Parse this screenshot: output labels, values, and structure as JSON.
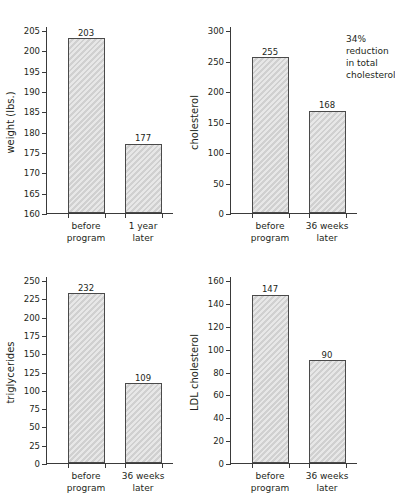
{
  "figure": {
    "panels": [
      {
        "name": "weight",
        "ylabel": "weight (lbs.)",
        "ticks": [
          "160",
          "165",
          "170",
          "175",
          "180",
          "185",
          "190",
          "195",
          "200",
          "205"
        ],
        "bars": [
          {
            "category": "before\nprogram",
            "value": "203"
          },
          {
            "category": "1 year\nlater",
            "value": "177"
          }
        ],
        "annotation": ""
      },
      {
        "name": "cholesterol",
        "ylabel": "cholesterol",
        "ticks": [
          "0",
          "50",
          "100",
          "150",
          "200",
          "250",
          "300"
        ],
        "bars": [
          {
            "category": "before\nprogram",
            "value": "255"
          },
          {
            "category": "36 weeks\nlater",
            "value": "168"
          }
        ],
        "annotation": "34%\nreduction\nin total\ncholesterol"
      },
      {
        "name": "triglycerides",
        "ylabel": "triglycerides",
        "ticks": [
          "0",
          "25",
          "50",
          "75",
          "100",
          "125",
          "150",
          "175",
          "200",
          "225",
          "250"
        ],
        "bars": [
          {
            "category": "before\nprogram",
            "value": "232"
          },
          {
            "category": "36 weeks\nlater",
            "value": "109"
          }
        ],
        "annotation": ""
      },
      {
        "name": "ldl-cholesterol",
        "ylabel": "LDL cholesterol",
        "ticks": [
          "0",
          "20",
          "40",
          "60",
          "80",
          "100",
          "120",
          "140",
          "160"
        ],
        "bars": [
          {
            "category": "before\nprogram",
            "value": "147"
          },
          {
            "category": "36 weeks\nlater",
            "value": "90"
          }
        ],
        "annotation": ""
      }
    ]
  },
  "chart_data": [
    {
      "type": "bar",
      "title": "",
      "xlabel": "",
      "ylabel": "weight (lbs.)",
      "categories": [
        "before program",
        "1 year later"
      ],
      "values": [
        203,
        177
      ],
      "ylim": [
        160,
        205
      ],
      "ytick_step": 5,
      "grid": false,
      "legend": "none",
      "bar_color": "#d4d4d4",
      "bar_edge_color": "#4a4a4a",
      "data_labels": [
        "203",
        "177"
      ]
    },
    {
      "type": "bar",
      "title": "",
      "xlabel": "",
      "ylabel": "cholesterol",
      "categories": [
        "before program",
        "36 weeks later"
      ],
      "values": [
        255,
        168
      ],
      "ylim": [
        0,
        300
      ],
      "ytick_step": 50,
      "grid": false,
      "legend": "none",
      "bar_color": "#d4d4d4",
      "bar_edge_color": "#4a4a4a",
      "data_labels": [
        "255",
        "168"
      ],
      "annotations": [
        "34% reduction in total cholesterol"
      ]
    },
    {
      "type": "bar",
      "title": "",
      "xlabel": "",
      "ylabel": "triglycerides",
      "categories": [
        "before program",
        "36 weeks later"
      ],
      "values": [
        232,
        109
      ],
      "ylim": [
        0,
        250
      ],
      "ytick_step": 25,
      "grid": false,
      "legend": "none",
      "bar_color": "#d4d4d4",
      "bar_edge_color": "#4a4a4a",
      "data_labels": [
        "232",
        "109"
      ]
    },
    {
      "type": "bar",
      "title": "",
      "xlabel": "",
      "ylabel": "LDL cholesterol",
      "categories": [
        "before program",
        "36 weeks later"
      ],
      "values": [
        147,
        90
      ],
      "ylim": [
        0,
        160
      ],
      "ytick_step": 20,
      "grid": false,
      "legend": "none",
      "bar_color": "#d4d4d4",
      "bar_edge_color": "#4a4a4a",
      "data_labels": [
        "147",
        "90"
      ]
    }
  ]
}
